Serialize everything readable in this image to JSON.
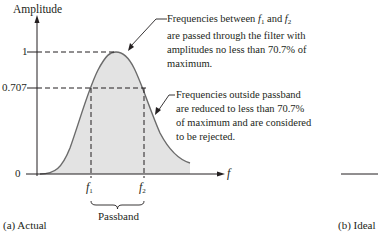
{
  "figure": {
    "y_axis_label": "Amplitude",
    "x_axis_label": "f",
    "ticks": {
      "one": "1",
      "cutoff": "0.707",
      "zero": "0"
    },
    "f1": "f",
    "f1_sub": "1",
    "f2": "f",
    "f2_sub": "2",
    "passband_label": "Passband",
    "caption_a": "(a) Actual",
    "caption_b": "(b) Ideal"
  },
  "annotations": {
    "passband_note": {
      "line1_pre": "Frequencies between ",
      "line1_mid": " and ",
      "line2": "are passed through the filter with",
      "line3": "amplitudes no less than 70.7% of",
      "line4": "maximum."
    },
    "reject_note": {
      "line1": "Frequencies outside passband",
      "line2": "are reduced to less than 70.7%",
      "line3": "of maximum and are considered",
      "line4": "to be rejected."
    }
  },
  "colors": {
    "ink": "#231f20",
    "fill": "#e3e3e3",
    "curve": "#6b6b6b"
  }
}
